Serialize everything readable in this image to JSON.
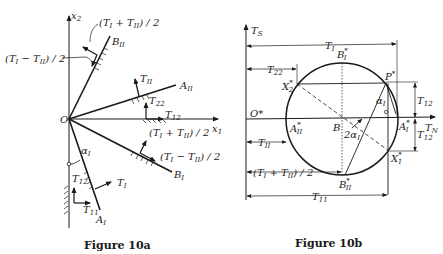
{
  "figure_a": {
    "caption": "Figure 10a",
    "origin_label": "O",
    "axis_x1": {
      "base": "x",
      "sub": "1"
    },
    "axis_x2": {
      "base": "x",
      "sub": "2"
    },
    "lines": {
      "B_II": {
        "base": "B",
        "sub": "II"
      },
      "A_II": {
        "base": "A",
        "sub": "II"
      },
      "B_I": {
        "base": "B",
        "sub": "I"
      },
      "A_I": {
        "base": "A",
        "sub": "I"
      }
    },
    "annotations": {
      "sum_half_top": "(T_I + T_II) / 2",
      "diff_half_left": "(T_I − T_II) / 2",
      "sum_half_right": "(T_I + T_II) / 2",
      "diff_half_right": "(T_I − T_II) / 2",
      "T_II": {
        "base": "T",
        "sub": "II"
      },
      "T_22": {
        "base": "T",
        "sub": "22"
      },
      "T_12_upper": {
        "base": "T",
        "sub": "12"
      },
      "T_12_lower": {
        "base": "T",
        "sub": "12"
      },
      "T_11": {
        "base": "T",
        "sub": "11"
      },
      "T_I": {
        "base": "T",
        "sub": "I"
      },
      "alpha_I": {
        "base": "α",
        "sub": "I"
      }
    }
  },
  "figure_b": {
    "caption": "Figure 10b",
    "origin_label": "O*",
    "axis_TS": {
      "base": "T",
      "sub": "S"
    },
    "axis_TN": {
      "base": "T",
      "sub": "N"
    },
    "center_label": "B",
    "points": {
      "B_I_star": {
        "base": "B",
        "sup": "*",
        "sub": "I"
      },
      "B_II_star": {
        "base": "B",
        "sup": "*",
        "sub": "II"
      },
      "A_I_star": {
        "base": "A",
        "sup": "*",
        "sub": "I"
      },
      "A_II_star": {
        "base": "A",
        "sup": "*",
        "sub": "II"
      },
      "P_star": {
        "base": "P",
        "sup": "*"
      },
      "X1_star": {
        "base": "X",
        "sup": "*",
        "sub": "1"
      },
      "X2_star": {
        "base": "X",
        "sup": "*",
        "sub": "2"
      }
    },
    "dimensions": {
      "T_I": {
        "base": "T",
        "sub": "I"
      },
      "T_22": {
        "base": "T",
        "sub": "22"
      },
      "T_12_upper": {
        "base": "T",
        "sub": "12"
      },
      "T_12_lower": {
        "base": "T",
        "sub": "12"
      },
      "T_II": {
        "base": "T",
        "sub": "II"
      },
      "sum_half": "(T_I + T_II) / 2",
      "T_11": {
        "base": "T",
        "sub": "11"
      }
    },
    "angles": {
      "alpha_I": {
        "base": "α",
        "sub": "I"
      },
      "two_alpha_I": {
        "base": "2α",
        "sub": "I"
      }
    }
  }
}
